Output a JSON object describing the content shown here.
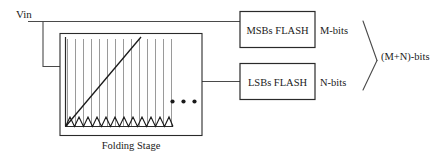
{
  "diagram": {
    "type": "block-diagram",
    "input": {
      "label": "Vin"
    },
    "folding_stage": {
      "caption": "Folding Stage",
      "ellipsis": "• • •",
      "num_vertical_lines": 14,
      "num_sawtooth_teeth": 7,
      "has_diagonal_ramp": true
    },
    "blocks": [
      {
        "id": "msbs-flash",
        "label": "MSBs FLASH",
        "output_label": "M-bits"
      },
      {
        "id": "lsbs-flash",
        "label": "LSBs FLASH",
        "output_label": "N-bits"
      }
    ],
    "combined_output": {
      "label": "(M+N)-bits"
    },
    "colors": {
      "background": "#ffffff",
      "wire": "#4a4a4a",
      "box_border": "#2a2a2a",
      "inner_line": "#8a8a8a",
      "curve": "#1a1a1a",
      "text": "#1a1a1a"
    }
  }
}
